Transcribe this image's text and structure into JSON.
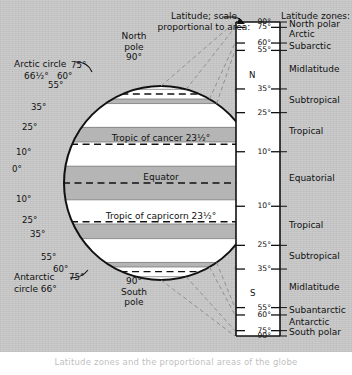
{
  "figure": {
    "title_callout": {
      "line1": "Latitude; scale",
      "line2": "proportional to area:"
    },
    "zones_header": "Latitude zones:",
    "caption": "Latitude zones and the proportional areas of the globe",
    "colors": {
      "background": "#c9c9c9",
      "band_light": "#ffffff",
      "band_shade": "#b5b5b5",
      "ink": "#111111",
      "rule_fill": "#ffffff"
    }
  },
  "globe": {
    "north_pole": {
      "line1": "North",
      "line2": "pole",
      "line3": "90°"
    },
    "south_pole": {
      "line1": "90°",
      "line2": "South",
      "line3": "pole"
    },
    "arctic_circle": {
      "line1": "Arctic circle",
      "line2": "66½°"
    },
    "antarctic_circle": {
      "line1": "Antarctic",
      "line2": "circle 66°"
    },
    "inner_labels": [
      {
        "text": "Tropic of cancer 23½°",
        "lat": 23.5
      },
      {
        "text": "Equator",
        "lat": 0
      },
      {
        "text": "Tropic of capricorn 23½°",
        "lat": -23.5
      }
    ],
    "edge_ticks_north": [
      "75°",
      "60°",
      "55°",
      "35°",
      "25°",
      "10°",
      "0°"
    ],
    "edge_ticks_south": [
      "10°",
      "25°",
      "35°",
      "55°",
      "60°",
      "75°"
    ]
  },
  "scale": {
    "hemisphere_north_label": "N",
    "hemisphere_south_label": "S",
    "ticks": [
      {
        "label": "90°",
        "value": 90
      },
      {
        "label": "75°",
        "value": 75
      },
      {
        "label": "60°",
        "value": 60
      },
      {
        "label": "55°",
        "value": 55
      },
      {
        "label": "35°",
        "value": 35
      },
      {
        "label": "25°",
        "value": 25
      },
      {
        "label": "10°",
        "value": 10
      },
      {
        "label": "10°",
        "value": -10
      },
      {
        "label": "25°",
        "value": -25
      },
      {
        "label": "35°",
        "value": -35
      },
      {
        "label": "55°",
        "value": -55
      },
      {
        "label": "60°",
        "value": -60
      },
      {
        "label": "75°",
        "value": -75
      },
      {
        "label": "90°",
        "value": -90
      }
    ],
    "zones": [
      {
        "name": "North polar",
        "from": 90,
        "to": 75
      },
      {
        "name": "Arctic",
        "from": 75,
        "to": 60
      },
      {
        "name": "Subarctic",
        "from": 60,
        "to": 55
      },
      {
        "name": "Midlatitude",
        "from": 55,
        "to": 35
      },
      {
        "name": "Subtropical",
        "from": 35,
        "to": 25
      },
      {
        "name": "Tropical",
        "from": 25,
        "to": 10
      },
      {
        "name": "Equatorial",
        "from": 10,
        "to": -10
      },
      {
        "name": "Tropical",
        "from": -10,
        "to": -25
      },
      {
        "name": "Subtropical",
        "from": -25,
        "to": -35
      },
      {
        "name": "Midlatitude",
        "from": -35,
        "to": -55
      },
      {
        "name": "Subantarctic",
        "from": -55,
        "to": -60
      },
      {
        "name": "Antarctic",
        "from": -60,
        "to": -75
      },
      {
        "name": "South polar",
        "from": -75,
        "to": -90
      }
    ]
  },
  "chart_data": {
    "type": "diagram",
    "zone_boundaries_deg": [
      90,
      75,
      60,
      55,
      35,
      25,
      10,
      -10,
      -25,
      -35,
      -55,
      -60,
      -75,
      -90
    ],
    "zone_names": [
      "North polar",
      "Arctic",
      "Subarctic",
      "Midlatitude",
      "Subtropical",
      "Tropical",
      "Equatorial",
      "Tropical",
      "Subtropical",
      "Midlatitude",
      "Subantarctic",
      "Antarctic",
      "South polar"
    ],
    "special_parallels": [
      {
        "name": "Arctic circle",
        "deg": 66.5
      },
      {
        "name": "Tropic of cancer",
        "deg": 23.5
      },
      {
        "name": "Equator",
        "deg": 0
      },
      {
        "name": "Tropic of capricorn",
        "deg": -23.5
      },
      {
        "name": "Antarctic circle",
        "deg": -66.0
      }
    ],
    "xlabel": "",
    "ylabel": "Latitude (degrees)",
    "ylim": [
      -90,
      90
    ]
  }
}
